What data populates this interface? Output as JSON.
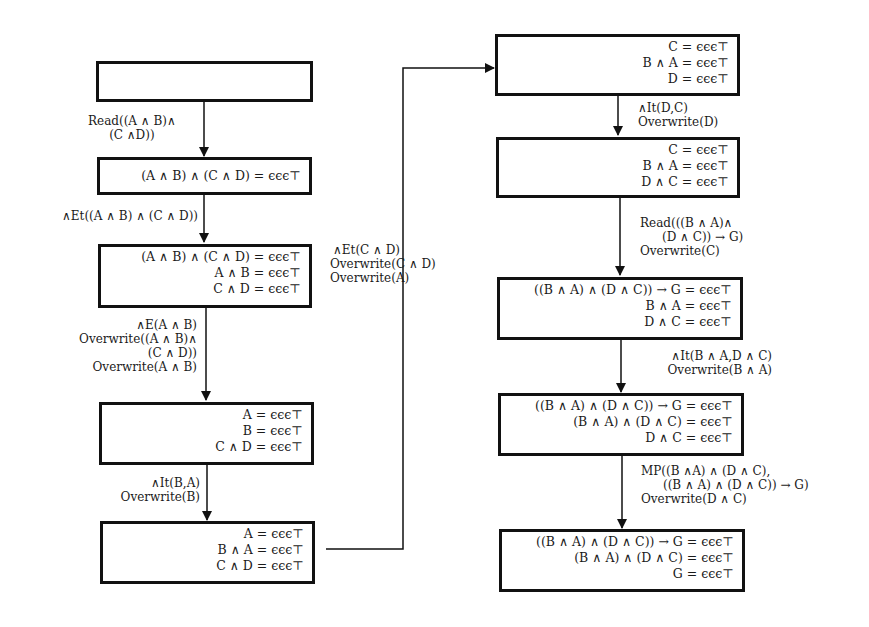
{
  "diagram": {
    "type": "flowchart",
    "left_column": {
      "boxes": [
        {
          "id": "L1",
          "lines": []
        },
        {
          "id": "L2",
          "lines": [
            "(A ∧ B) ∧ (C ∧ D) = ϵϵϵ⊤"
          ]
        },
        {
          "id": "L3",
          "lines": [
            "(A ∧ B) ∧ (C ∧ D) = ϵϵϵ⊤",
            "A ∧ B = ϵϵϵ⊤",
            "C ∧ D = ϵϵϵ⊤"
          ]
        },
        {
          "id": "L4",
          "lines": [
            "A = ϵϵϵ⊤",
            "B = ϵϵϵ⊤",
            "C ∧ D = ϵϵϵ⊤"
          ]
        },
        {
          "id": "L5",
          "lines": [
            "A = ϵϵϵ⊤",
            "B ∧ A = ϵϵϵ⊤",
            "C ∧ D = ϵϵϵ⊤"
          ]
        }
      ],
      "edges": [
        {
          "from": "L1",
          "to": "L2",
          "lines": [
            "Read((A ∧ B)∧",
            "(C ∧D))"
          ]
        },
        {
          "from": "L2",
          "to": "L3",
          "lines": [
            "∧Et((A ∧ B) ∧ (C ∧ D))"
          ]
        },
        {
          "from": "L3",
          "to": "L4",
          "lines": [
            "∧E(A ∧ B)",
            "Overwrite((A ∧ B)∧",
            "(C ∧ D))",
            "Overwrite(A ∧ B)"
          ]
        },
        {
          "from": "L4",
          "to": "L5",
          "lines": [
            "∧It(B,A)",
            "Overwrite(B)"
          ]
        }
      ]
    },
    "connector": {
      "from": "L5",
      "to": "R1",
      "lines": [
        "∧Et(C ∧ D)",
        "Overwrite(C ∧ D)",
        "Overwrite(A)"
      ]
    },
    "right_column": {
      "boxes": [
        {
          "id": "R1",
          "lines": [
            "C = ϵϵϵ⊤",
            "B ∧ A = ϵϵϵ⊤",
            "D = ϵϵϵ⊤"
          ]
        },
        {
          "id": "R2",
          "lines": [
            "C = ϵϵϵ⊤",
            "B ∧ A = ϵϵϵ⊤",
            "D ∧ C = ϵϵϵ⊤"
          ]
        },
        {
          "id": "R3",
          "lines": [
            "((B ∧ A) ∧ (D ∧ C)) → G = ϵϵϵ⊤",
            "B ∧ A = ϵϵϵ⊤",
            "D ∧ C = ϵϵϵ⊤"
          ]
        },
        {
          "id": "R4",
          "lines": [
            "((B ∧ A) ∧ (D ∧ C)) → G = ϵϵϵ⊤",
            "(B ∧ A) ∧ (D ∧ C) = ϵϵϵ⊤",
            "D ∧ C = ϵϵϵ⊤"
          ]
        },
        {
          "id": "R5",
          "lines": [
            "((B ∧ A) ∧ (D ∧ C)) → G = ϵϵϵ⊤",
            "(B ∧ A) ∧ (D ∧ C) = ϵϵϵ⊤",
            "G = ϵϵϵ⊤"
          ]
        }
      ],
      "edges": [
        {
          "from": "R1",
          "to": "R2",
          "lines": [
            "∧It(D,C)",
            "Overwrite(D)"
          ]
        },
        {
          "from": "R2",
          "to": "R3",
          "lines": [
            "Read(((B ∧ A)∧",
            "(D ∧ C)) → G)",
            "Overwrite(C)"
          ]
        },
        {
          "from": "R3",
          "to": "R4",
          "lines": [
            "∧It(B ∧ A,D ∧ C)",
            "Overwrite(B ∧ A)"
          ]
        },
        {
          "from": "R4",
          "to": "R5",
          "lines": [
            "MP((B ∧A) ∧ (D ∧ C),",
            "((B ∧ A) ∧ (D ∧ C)) → G)",
            "Overwrite(D ∧ C)"
          ]
        }
      ]
    }
  }
}
